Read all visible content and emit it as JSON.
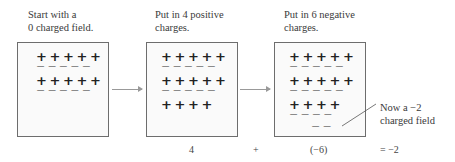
{
  "panels": [
    {
      "caption_line1": "Start with a",
      "caption_line2": "0 charged field.",
      "rows": [
        "+++++",
        "−−−−−",
        "+++++",
        "−−−−−"
      ]
    },
    {
      "caption_line1": "Put in 4 positive",
      "caption_line2": "charges.",
      "rows": [
        "+++++",
        "−−−−−",
        "+++++",
        "−−−−−",
        "++++"
      ]
    },
    {
      "caption_line1": "Put in 6 negative",
      "caption_line2": "charges.",
      "rows": [
        "+++++",
        "−−−−−",
        "+++++",
        "−−−−−",
        "++++",
        "−−−−",
        "−−"
      ]
    }
  ],
  "annotation": {
    "line1": "Now a −2",
    "line2": "charged field"
  },
  "equation": {
    "term1": "4",
    "operator": "+",
    "term2": "(−6)",
    "result": "= −2"
  }
}
